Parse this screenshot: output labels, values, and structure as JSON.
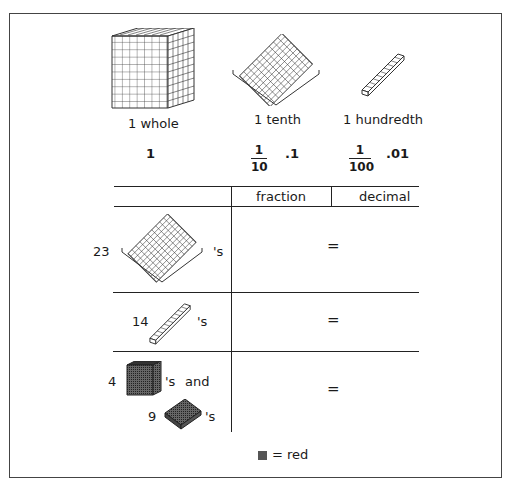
{
  "units": [
    {
      "icon": "thousand-cube-icon",
      "label": "1 whole",
      "value": "1"
    },
    {
      "icon": "flat-block-icon",
      "label": "1 tenth",
      "fraction": {
        "num": "1",
        "den": "10"
      },
      "decimal": ".1"
    },
    {
      "icon": "rod-block-icon",
      "label": "1 hundredth",
      "fraction": {
        "num": "1",
        "den": "100"
      },
      "decimal": ".01"
    }
  ],
  "table": {
    "headers": [
      "",
      "fraction",
      "decimal"
    ],
    "rows": [
      {
        "count": "23",
        "block": "flat",
        "suffix": "'s",
        "equals": "="
      },
      {
        "count": "14",
        "block": "rod",
        "suffix": "'s",
        "equals": "="
      },
      {
        "count_a": "4",
        "block_a": "cube-red",
        "suffix_a": "'s",
        "and": "and",
        "count_b": "9",
        "block_b": "flat-red",
        "suffix_b": "'s",
        "equals": "="
      }
    ]
  },
  "legend": {
    "text": "= red",
    "swatch_color": "#555555"
  }
}
